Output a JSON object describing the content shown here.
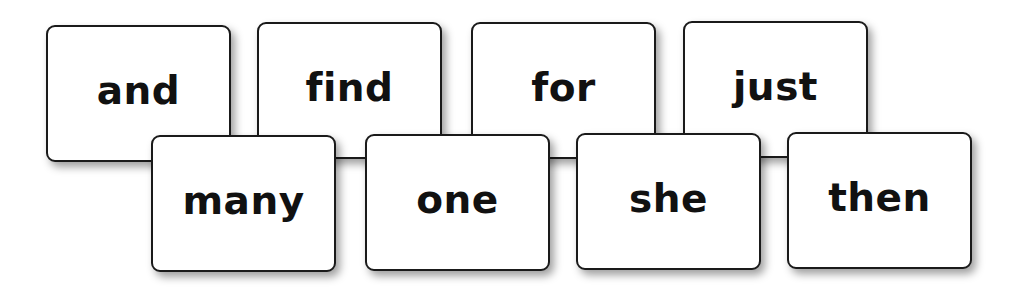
{
  "cards": {
    "row1": [
      {
        "word": "and",
        "x": 46,
        "y": 25
      },
      {
        "word": "find",
        "x": 257,
        "y": 22
      },
      {
        "word": "for",
        "x": 471,
        "y": 22
      },
      {
        "word": "just",
        "x": 683,
        "y": 21
      }
    ],
    "row2": [
      {
        "word": "many",
        "x": 151,
        "y": 135
      },
      {
        "word": "one",
        "x": 365,
        "y": 134
      },
      {
        "word": "she",
        "x": 576,
        "y": 133
      },
      {
        "word": "then",
        "x": 787,
        "y": 132
      }
    ]
  }
}
